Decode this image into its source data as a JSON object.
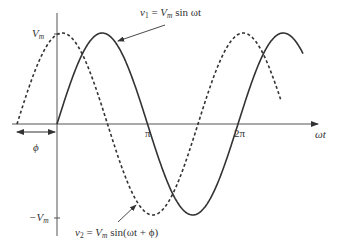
{
  "figure": {
    "type": "phase-shift sinusoid diagram",
    "axes": {
      "x_label": "ωt",
      "y_max_label": "V",
      "y_max_sub": "m",
      "y_min_label": "−V",
      "y_min_sub": "m",
      "x_ticks": [
        "π",
        "2π"
      ]
    },
    "phase_label": "ϕ",
    "curves": [
      {
        "name": "v1",
        "style": "solid",
        "label_lhs": "v",
        "label_lhs_sub": "1",
        "label_eq": " = ",
        "label_amp": "V",
        "label_amp_sub": "m",
        "label_rhs": " sin ωt"
      },
      {
        "name": "v2",
        "style": "dashed",
        "label_lhs": "v",
        "label_lhs_sub": "2",
        "label_eq": " = ",
        "label_amp": "V",
        "label_amp_sub": "m",
        "label_rhs": " sin(ωt + ϕ)"
      }
    ],
    "colors": {
      "line": "#333333",
      "axis": "#444444",
      "background": "#ffffff"
    }
  }
}
